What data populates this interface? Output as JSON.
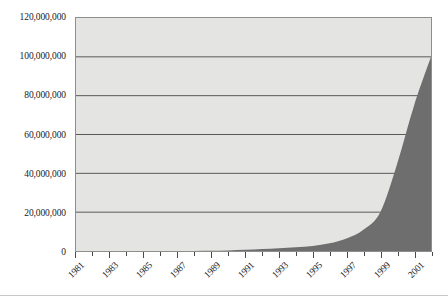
{
  "chart_data": {
    "type": "area",
    "title": "",
    "subtitle": "",
    "xlabel": "",
    "ylabel": "",
    "x": [
      1981,
      1982,
      1983,
      1984,
      1985,
      1986,
      1987,
      1988,
      1989,
      1990,
      1991,
      1992,
      1993,
      1994,
      1995,
      1996,
      1997,
      1998,
      1999,
      2000,
      2001,
      2002
    ],
    "values": [
      0,
      0,
      0,
      0,
      0,
      0,
      0,
      0,
      100000,
      300000,
      600000,
      1000000,
      1400000,
      1900000,
      2600000,
      4000000,
      6500000,
      11000000,
      20000000,
      45000000,
      75000000,
      100000000
    ],
    "series": [
      {
        "name": "Series 1",
        "values": [
          0,
          0,
          0,
          0,
          0,
          0,
          0,
          0,
          100000,
          300000,
          600000,
          1000000,
          1400000,
          1900000,
          2600000,
          4000000,
          6500000,
          11000000,
          20000000,
          45000000,
          75000000,
          100000000
        ]
      }
    ],
    "ylim": [
      0,
      120000000
    ],
    "xlim": [
      1981,
      2002
    ],
    "y_ticks": [
      0,
      20000000,
      40000000,
      60000000,
      80000000,
      100000000,
      120000000
    ],
    "y_tick_labels": [
      "0",
      "20,000,000",
      "40,000,000",
      "60,000,000",
      "80,000,000",
      "100,000,000",
      "120,000,000"
    ],
    "x_tick_values": [
      1981,
      1982,
      1983,
      1984,
      1985,
      1986,
      1987,
      1988,
      1989,
      1990,
      1991,
      1992,
      1993,
      1994,
      1995,
      1996,
      1997,
      1998,
      1999,
      2000,
      2001,
      2002
    ],
    "x_tick_labels": [
      "1981",
      "1983",
      "1985",
      "1987",
      "1989",
      "1991",
      "1993",
      "1995",
      "1997",
      "1999",
      "2001"
    ],
    "x_labeled_values": [
      1981,
      1983,
      1985,
      1987,
      1989,
      1991,
      1993,
      1995,
      1997,
      1999,
      2001
    ],
    "grid": true,
    "grid_axis": "y",
    "legend": false,
    "legend_position": "none",
    "colors": {
      "area_fill": "#6e6e6e",
      "plot_background": "#e4e4e2",
      "gridline": "#5a5a5a",
      "axis_line": "#4a4a4a",
      "frame": "#8e8e8e",
      "text": "#1a1a1a",
      "page_background": "#ffffff",
      "bottom_rule": "#c9c9c9"
    }
  }
}
